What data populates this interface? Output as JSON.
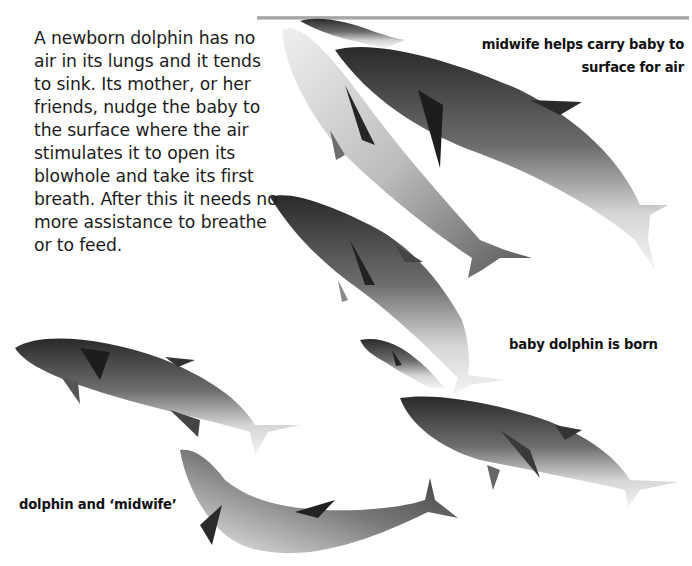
{
  "page": {
    "intro_text": "A newborn dolphin has no air in its lungs and it tends to sink. Its mother, or her friends, nudge the baby to the surface where the air stimulates it to open its blowhole and take its first breath. After this it needs no more assistance to breathe or to feed.",
    "captions": {
      "midwife_carry_line1": "midwife helps carry baby to",
      "midwife_carry_line2": "surface for air",
      "baby_born": "baby dolphin is born",
      "dolphin_and_midwife": "dolphin and ‘midwife’"
    },
    "illustrations": [
      {
        "id": "adult-surface-left",
        "label": "adult dolphin near surface"
      },
      {
        "id": "adult-surface-right",
        "label": "midwife dolphin"
      },
      {
        "id": "baby-surface",
        "label": "baby dolphin at surface"
      },
      {
        "id": "adult-middle",
        "label": "mother dolphin"
      },
      {
        "id": "baby-born",
        "label": "newborn baby dolphin"
      },
      {
        "id": "adult-lower-right",
        "label": "mother dolphin giving birth"
      },
      {
        "id": "adult-lower-left",
        "label": "dolphin"
      },
      {
        "id": "adult-bottom",
        "label": "midwife dolphin"
      }
    ],
    "colors": {
      "text": "#1c1c1c",
      "background": "#ffffff",
      "waterline": "#a8a8a8"
    }
  }
}
